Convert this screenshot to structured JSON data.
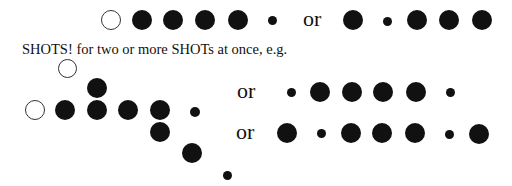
{
  "caption": "SHOTS! for two or more SHOTs at once, e.g.",
  "connector": "or",
  "colors": {
    "filled": "#111111",
    "open_stroke": "#333333",
    "background": "#ffffff"
  },
  "rows": [
    {
      "id": "top-example",
      "dots": [
        {
          "type": "open",
          "x": 111,
          "y": 20,
          "r": 10
        },
        {
          "type": "filled",
          "x": 142,
          "y": 20,
          "r": 10
        },
        {
          "type": "filled",
          "x": 173,
          "y": 20,
          "r": 10
        },
        {
          "type": "filled",
          "x": 205,
          "y": 20,
          "r": 10
        },
        {
          "type": "filled",
          "x": 238,
          "y": 20,
          "r": 10
        },
        {
          "type": "small",
          "x": 272,
          "y": 20,
          "r": 4.5
        }
      ],
      "or_label": {
        "x": 303,
        "y": 8
      },
      "alt_dots": [
        {
          "type": "filled",
          "x": 353,
          "y": 20,
          "r": 10
        },
        {
          "type": "small",
          "x": 387,
          "y": 21,
          "r": 4.5
        },
        {
          "type": "filled",
          "x": 417,
          "y": 20,
          "r": 10
        },
        {
          "type": "filled",
          "x": 449,
          "y": 20,
          "r": 10
        },
        {
          "type": "filled",
          "x": 482,
          "y": 20,
          "r": 10
        }
      ]
    },
    {
      "id": "multi-shot-example",
      "dots": [
        {
          "type": "open",
          "x": 67,
          "y": 68,
          "r": 9.5
        },
        {
          "type": "filled",
          "x": 97,
          "y": 88,
          "r": 10
        },
        {
          "type": "open",
          "x": 35,
          "y": 110,
          "r": 10
        },
        {
          "type": "filled",
          "x": 65,
          "y": 110,
          "r": 10
        },
        {
          "type": "filled",
          "x": 97,
          "y": 110,
          "r": 10
        },
        {
          "type": "filled",
          "x": 128,
          "y": 110,
          "r": 10
        },
        {
          "type": "filled",
          "x": 160,
          "y": 110,
          "r": 10
        },
        {
          "type": "small",
          "x": 195,
          "y": 112,
          "r": 5
        },
        {
          "type": "filled",
          "x": 160,
          "y": 132,
          "r": 10
        },
        {
          "type": "filled",
          "x": 192,
          "y": 153,
          "r": 10
        },
        {
          "type": "small",
          "x": 227,
          "y": 175,
          "r": 4.5
        }
      ],
      "alternatives": [
        {
          "or_label": {
            "x": 237,
            "y": 80
          },
          "dots": [
            {
              "type": "small",
              "x": 291,
              "y": 92,
              "r": 4.5
            },
            {
              "type": "filled",
              "x": 320,
              "y": 92,
              "r": 10
            },
            {
              "type": "filled",
              "x": 352,
              "y": 92,
              "r": 10
            },
            {
              "type": "filled",
              "x": 383,
              "y": 92,
              "r": 10
            },
            {
              "type": "filled",
              "x": 416,
              "y": 92,
              "r": 10
            },
            {
              "type": "small",
              "x": 450,
              "y": 92,
              "r": 4.5
            }
          ]
        },
        {
          "or_label": {
            "x": 236,
            "y": 121
          },
          "dots": [
            {
              "type": "filled",
              "x": 287,
              "y": 133,
              "r": 10
            },
            {
              "type": "small",
              "x": 321,
              "y": 133,
              "r": 4.5
            },
            {
              "type": "filled",
              "x": 351,
              "y": 133,
              "r": 10
            },
            {
              "type": "filled",
              "x": 382,
              "y": 133,
              "r": 10
            },
            {
              "type": "filled",
              "x": 415,
              "y": 133,
              "r": 10
            },
            {
              "type": "small",
              "x": 449,
              "y": 134,
              "r": 4.5
            },
            {
              "type": "filled",
              "x": 479,
              "y": 134,
              "r": 10
            }
          ]
        }
      ]
    }
  ]
}
